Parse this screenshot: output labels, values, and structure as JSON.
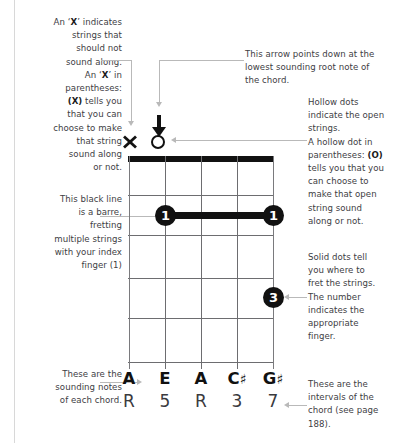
{
  "figure": {
    "type": "guitar-chord-diagram-legend",
    "chord": {
      "strings": 5,
      "frets": 5,
      "markers_above_nut": [
        {
          "string": 1,
          "symbol": "X",
          "meaning": "muted"
        },
        {
          "string": 2,
          "symbol": "O",
          "meaning": "open"
        }
      ],
      "arrow": {
        "points_to_string": 2,
        "glyph": "down-arrow"
      },
      "barre": {
        "fret": 1,
        "from_string": 2,
        "to_string": 5,
        "finger": "1"
      },
      "dots": [
        {
          "string": 2,
          "fret": 1,
          "finger": "1"
        },
        {
          "string": 5,
          "fret": 1,
          "finger": "1"
        },
        {
          "string": 5,
          "fret": 4,
          "finger": "3"
        }
      ],
      "note_names": [
        "A",
        "E",
        "A",
        "C",
        "G"
      ],
      "note_accidentals": [
        "",
        "",
        "",
        "♯",
        "♯"
      ],
      "intervals": [
        "R",
        "5",
        "R",
        "3",
        "7"
      ]
    }
  },
  "annotations": {
    "x_marker": "An 'X' indicates strings that should not sound along. An 'X' in parentheses: (X) tells you that you can choose to make that string sound along or not.",
    "x_marker_lines": [
      "An ‘X’ indicates",
      "strings that",
      "should not",
      "sound along.",
      "An ‘X’ in",
      "parentheses:",
      "(X) tells you",
      "that you can",
      "choose to make",
      "that string",
      "sound along",
      "or not."
    ],
    "barre": "This black line is a barre, fretting multiple strings with your index finger (1)",
    "barre_lines": [
      "This black line",
      "is a barre,",
      "fretting",
      "multiple strings",
      "with your index",
      "finger (1)"
    ],
    "sounding_notes": "These are the sounding notes of each chord.",
    "sounding_notes_lines": [
      "These are the",
      "sounding notes",
      "of each chord."
    ],
    "arrow": "This arrow points down at the lowest sounding root note of the chord.",
    "arrow_lines": [
      "This arrow points down at the",
      "lowest sounding root note of",
      "the chord."
    ],
    "hollow_dots": "Hollow dots indicate the open strings. A hollow dot in parentheses: (O) tells you that you can choose to make that open string sound along or not.",
    "hollow_dots_lines": [
      "Hollow dots",
      "indicate the open",
      "strings.",
      "A hollow dot in",
      "parentheses: (O)",
      "tells you that you",
      "can choose to",
      "make that open",
      "string sound",
      "along or not."
    ],
    "solid_dots": "Solid dots tell you where to fret the strings. The number indicates the appropriate finger.",
    "solid_dots_lines": [
      "Solid dots tell",
      "you where to",
      "fret the strings.",
      "The number",
      "indicates the",
      "appropriate",
      "finger."
    ],
    "intervals_note": "These are the intervals of the chord (see page 188).",
    "intervals_note_lines": [
      "These are the",
      "intervals of the",
      "chord (see page",
      "188)."
    ]
  },
  "colors": {
    "ink": "#111111",
    "text": "#404044",
    "leader": "#b9b9b9",
    "grid": "#6d6d70",
    "page_rule": "#d8d8d8",
    "background": "#ffffff"
  }
}
